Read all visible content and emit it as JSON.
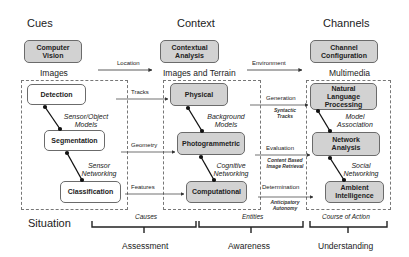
{
  "columns": {
    "cues": "Cues",
    "context": "Context",
    "channels": "Channels"
  },
  "top_boxes": {
    "computer_vision": "Computer\nVision",
    "contextual_analysis": "Contextual\nAnalysis",
    "channel_configuration": "Channel\nConfiguration"
  },
  "top_edges": {
    "location": "Location",
    "environment": "Environment"
  },
  "sections": {
    "images": "Images",
    "images_terrain": "Images and Terrain",
    "multimedia": "Multimedia"
  },
  "left_group": {
    "detection": "Detection",
    "segmentation": "Segmentation",
    "classification": "Classification",
    "link1": "Sensor/Object\nModels",
    "link2": "Sensor\nNetworking"
  },
  "middle_group": {
    "physical": "Physical",
    "photogrammetric": "Photogrammetric",
    "computational": "Computational",
    "link1": "Background\nModels",
    "link2": "Cognitive\nNetworking"
  },
  "right_group": {
    "nlp": "Natural\nLanguage\nProcessing",
    "network_analysis": "Network\nAnalysis",
    "ambient_intelligence": "Ambient\nIntelligence",
    "link1": "Model\nAssociation",
    "link2": "Social\nNetworking"
  },
  "left_to_middle_edges": {
    "tracks": "Tracks",
    "geometry": "Geometry",
    "features": "Features"
  },
  "middle_to_right_edges": {
    "generation": "Generation",
    "generation_sub": "Syntactic\nTracks",
    "evaluation": "Evaluation",
    "evaluation_sub": "Content Based\nImage Retrieval",
    "determination": "Determination",
    "determination_sub": "Anticipatory\nAutonomy"
  },
  "situation": "Situation",
  "braces": {
    "causes": "Causes",
    "entities": "Entities",
    "course_of_action": "Course of Action"
  },
  "bottom": {
    "assessment": "Assessment",
    "awareness": "Awareness",
    "understanding": "Understanding"
  },
  "colors": {
    "box_fill": "#d2d2d2",
    "box_border": "#6b6b6b",
    "line": "#333333"
  }
}
